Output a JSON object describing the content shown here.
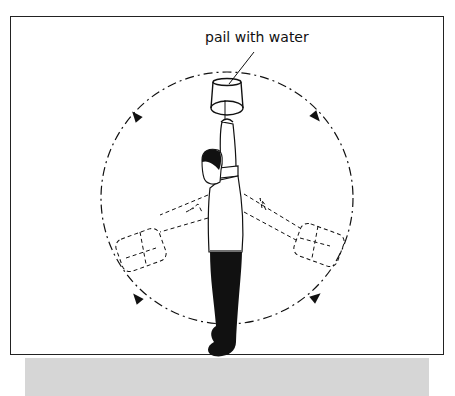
{
  "figure": {
    "label": "pail with water",
    "colors": {
      "line": "#111111",
      "frame": "#222222",
      "shadow": "#d6d6d6",
      "background": "#ffffff"
    },
    "circle": {
      "cx": 227,
      "cy": 198,
      "r": 126,
      "style": "dash-dot"
    },
    "arrows": [
      {
        "position": "top-left",
        "x": 136,
        "y": 116
      },
      {
        "position": "top-right",
        "x": 316,
        "y": 117
      },
      {
        "position": "bottom-left",
        "x": 137,
        "y": 298
      },
      {
        "position": "bottom-right",
        "x": 316,
        "y": 297
      }
    ]
  }
}
